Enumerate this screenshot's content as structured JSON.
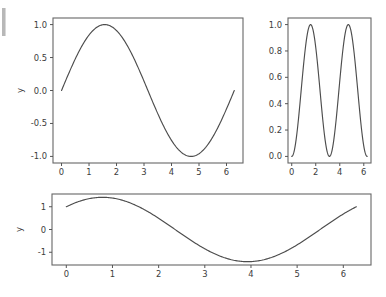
{
  "figure": {
    "width": 386,
    "height": 297,
    "background_color": "#ffffff",
    "line_color": "#4d4d4d",
    "frame_color": "#666666",
    "tick_text_color": "#3c3c3c"
  },
  "chart_data": [
    {
      "id": "top-left",
      "type": "line",
      "title": "",
      "xlabel": "",
      "ylabel": "y",
      "xlim": [
        -0.31,
        6.6
      ],
      "ylim": [
        -1.1,
        1.1
      ],
      "xticks": [
        0,
        1,
        2,
        3,
        4,
        5,
        6
      ],
      "xticklabels": [
        "0",
        "1",
        "2",
        "3",
        "4",
        "5",
        "6"
      ],
      "yticks": [
        -1.0,
        -0.5,
        0.0,
        0.5,
        1.0
      ],
      "yticklabels": [
        "-1.0",
        "-0.5",
        "0.0",
        "0.5",
        "1.0"
      ],
      "grid": false,
      "legend": null,
      "series": [
        {
          "name": "sin(x)",
          "expression": "sin",
          "amplitude": 1.0,
          "frequency": 1.0,
          "phase": 0.0,
          "offset": 0.0,
          "x_start": 0.0,
          "x_end": 6.283185,
          "x": [
            0.0,
            0.3142,
            0.6283,
            0.9425,
            1.2566,
            1.5708,
            1.885,
            2.1991,
            2.5133,
            2.8274,
            3.1416,
            3.4558,
            3.7699,
            4.0841,
            4.3982,
            4.7124,
            5.0265,
            5.3407,
            5.6549,
            5.969,
            6.2832
          ],
          "y": [
            0.0,
            0.309,
            0.5878,
            0.809,
            0.9511,
            1.0,
            0.9511,
            0.809,
            0.5878,
            0.309,
            0.0,
            -0.309,
            -0.5878,
            -0.809,
            -0.9511,
            -1.0,
            -0.9511,
            -0.809,
            -0.5878,
            -0.309,
            0.0
          ]
        }
      ]
    },
    {
      "id": "top-right",
      "type": "line",
      "title": "",
      "xlabel": "",
      "ylabel": "",
      "xlim": [
        -0.31,
        6.6
      ],
      "ylim": [
        -0.05,
        1.05
      ],
      "xticks": [
        0,
        2,
        4,
        6
      ],
      "xticklabels": [
        "0",
        "2",
        "4",
        "6"
      ],
      "yticks": [
        0.0,
        0.2,
        0.4,
        0.6,
        0.8,
        1.0
      ],
      "yticklabels": [
        "0.0",
        "0.2",
        "0.4",
        "0.6",
        "0.8",
        "1.0"
      ],
      "grid": false,
      "legend": null,
      "series": [
        {
          "name": "sin(x)^2",
          "expression": "sin_squared",
          "amplitude": 1.0,
          "frequency": 1.0,
          "phase": 0.0,
          "offset": 0.0,
          "x_start": 0.0,
          "x_end": 6.283185,
          "x": [
            0.0,
            0.3142,
            0.6283,
            0.9425,
            1.2566,
            1.5708,
            1.885,
            2.1991,
            2.5133,
            2.8274,
            3.1416,
            3.4558,
            3.7699,
            4.0841,
            4.3982,
            4.7124,
            5.0265,
            5.3407,
            5.6549,
            5.969,
            6.2832
          ],
          "y": [
            0.0,
            0.0955,
            0.3455,
            0.6545,
            0.9045,
            1.0,
            0.9045,
            0.6545,
            0.3455,
            0.0955,
            0.0,
            0.0955,
            0.3455,
            0.6545,
            0.9045,
            1.0,
            0.9045,
            0.6545,
            0.3455,
            0.0955,
            0.0
          ]
        }
      ]
    },
    {
      "id": "bottom",
      "type": "line",
      "title": "",
      "xlabel": "",
      "ylabel": "y",
      "xlim": [
        -0.31,
        6.6
      ],
      "ylim": [
        -1.56,
        1.56
      ],
      "xticks": [
        0,
        1,
        2,
        3,
        4,
        5,
        6
      ],
      "xticklabels": [
        "0",
        "1",
        "2",
        "3",
        "4",
        "5",
        "6"
      ],
      "yticks": [
        -1,
        0,
        1
      ],
      "yticklabels": [
        "-1",
        "0",
        "1"
      ],
      "grid": false,
      "legend": null,
      "series": [
        {
          "name": "sin(x) + cos(x)",
          "expression": "sin_plus_cos",
          "amplitude": 1.41421,
          "frequency": 1.0,
          "phase": 0.7854,
          "offset": 0.0,
          "x_start": 0.0,
          "x_end": 6.283185,
          "x": [
            0.0,
            0.3142,
            0.6283,
            0.9425,
            1.2566,
            1.5708,
            1.885,
            2.1991,
            2.5133,
            2.8274,
            3.1416,
            3.4558,
            3.7699,
            4.0841,
            4.3982,
            4.7124,
            5.0265,
            5.3407,
            5.6549,
            5.969,
            6.2832
          ],
          "y": [
            1.0,
            1.2601,
            1.3968,
            1.3968,
            1.2601,
            1.0,
            0.6498,
            0.2457,
            -0.1756,
            -0.5781,
            -1.0,
            -1.2601,
            -1.3968,
            -1.3968,
            -1.2601,
            -1.0,
            -0.6498,
            -0.2457,
            0.1756,
            0.5781,
            1.0
          ]
        }
      ]
    }
  ],
  "axes_geometry": {
    "top_left": {
      "x": 53,
      "y": 18,
      "width": 190,
      "height": 145
    },
    "top_right": {
      "x": 288,
      "y": 18,
      "width": 83,
      "height": 145
    },
    "bottom": {
      "x": 52,
      "y": 194,
      "width": 319,
      "height": 71
    }
  }
}
